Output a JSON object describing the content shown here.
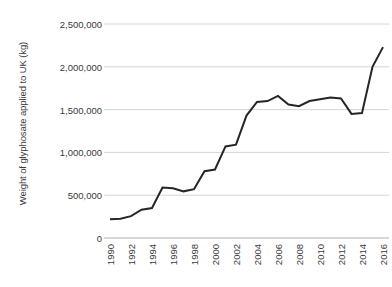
{
  "chart_data": {
    "type": "line",
    "title": "",
    "xlabel": "",
    "ylabel": "Weight of glyphosate applied to UK (kg)",
    "grid": true,
    "legend": false,
    "xlim": [
      1990,
      2016
    ],
    "ylim": [
      0,
      2500000
    ],
    "ytick_labels": [
      "2,500,000",
      "2,000,000",
      "1,500,000",
      "1,000,000",
      "500,000",
      "0"
    ],
    "ytick_values": [
      2500000,
      2000000,
      1500000,
      1000000,
      500000,
      0
    ],
    "xtick_labels": [
      "1990",
      "1992",
      "1994",
      "1996",
      "1998",
      "2000",
      "2002",
      "2004",
      "2006",
      "2008",
      "2010",
      "2012",
      "2014",
      "2016"
    ],
    "xtick_values": [
      1990,
      1992,
      1994,
      1996,
      1998,
      2000,
      2002,
      2004,
      2006,
      2008,
      2010,
      2012,
      2014,
      2016
    ],
    "x": [
      1990,
      1991,
      1992,
      1993,
      1994,
      1995,
      1996,
      1997,
      1998,
      1999,
      2000,
      2001,
      2002,
      2003,
      2004,
      2005,
      2006,
      2007,
      2008,
      2009,
      2010,
      2011,
      2012,
      2013,
      2014,
      2015,
      2016
    ],
    "values": [
      220000,
      225000,
      255000,
      330000,
      350000,
      590000,
      580000,
      545000,
      570000,
      780000,
      800000,
      1070000,
      1090000,
      1430000,
      1590000,
      1600000,
      1660000,
      1560000,
      1540000,
      1600000,
      1620000,
      1640000,
      1630000,
      1450000,
      1460000,
      2000000,
      2230000
    ],
    "series": [
      {
        "name": "Weight of glyphosate applied to UK (kg)",
        "color": "#262626",
        "values": [
          220000,
          225000,
          255000,
          330000,
          350000,
          590000,
          580000,
          545000,
          570000,
          780000,
          800000,
          1070000,
          1090000,
          1430000,
          1590000,
          1600000,
          1660000,
          1560000,
          1540000,
          1600000,
          1620000,
          1640000,
          1630000,
          1450000,
          1460000,
          2000000,
          2230000
        ]
      }
    ],
    "colors": {
      "line": "#262626",
      "grid": "#c9c9c9",
      "axis": "#a6a6a6",
      "text": "#3a3a3a",
      "background": "#ffffff"
    }
  }
}
